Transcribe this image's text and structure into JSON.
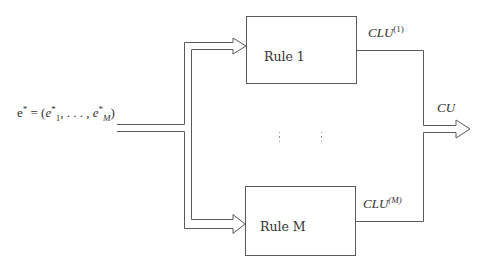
{
  "diagram": {
    "input_label": {
      "vector": "e",
      "star": "*",
      "equals": " = (",
      "first_var": "e",
      "first_sub": "1",
      "ellipsis": ", . . . , ",
      "last_var": "e",
      "last_sub": "M",
      "close": ")"
    },
    "rules": [
      {
        "label": "Rule 1",
        "output_base": "CLU",
        "output_sup": "(1)"
      },
      {
        "label": "Rule M",
        "output_base": "CLU",
        "output_sup": "(M)"
      }
    ],
    "output_label": "CU",
    "colors": {
      "stroke": "#555555",
      "text": "#333333",
      "background": "#ffffff"
    }
  }
}
